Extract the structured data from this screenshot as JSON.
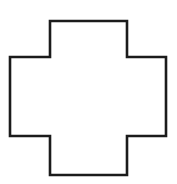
{
  "figure": {
    "name": "cross-shape-outline",
    "shape_type": "polygon",
    "canvas": {
      "width": 177,
      "height": 184,
      "background_color": "#ffffff"
    },
    "style": {
      "stroke_color": "#1b1b1b",
      "stroke_width": 2.6,
      "fill_color": "#ffffff",
      "corner_style": "sharp"
    },
    "geometry": {
      "vertex_count": 12,
      "arm_top_y": 21,
      "arm_bottom_y": 175,
      "arm_left_x": 10,
      "arm_right_x": 166,
      "notch_left_x": 50,
      "notch_right_x": 127,
      "notch_top_y": 57,
      "notch_bottom_y": 136,
      "points": [
        [
          50,
          21
        ],
        [
          127,
          21
        ],
        [
          127,
          57
        ],
        [
          166,
          57
        ],
        [
          166,
          136
        ],
        [
          127,
          136
        ],
        [
          127,
          175
        ],
        [
          50,
          175
        ],
        [
          50,
          136
        ],
        [
          10,
          136
        ],
        [
          10,
          57
        ],
        [
          50,
          57
        ]
      ],
      "points_string": "50,21 127,21 127,57 166,57 166,136 127,136 127,175 50,175 50,136 10,136 10,57 50,57"
    }
  }
}
